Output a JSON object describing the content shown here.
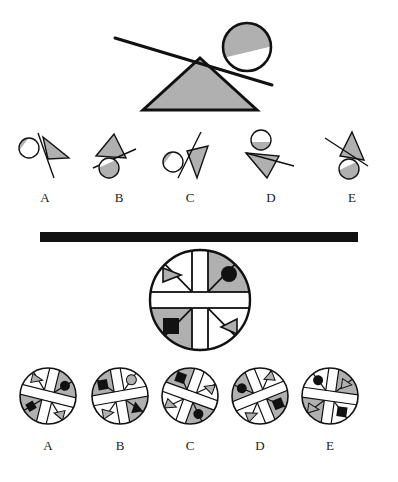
{
  "figure": {
    "title": "",
    "type": "visual-analogy-puzzle",
    "panels": [
      {
        "id": "top",
        "name": "upper-problem-panel",
        "prompt_figure": {
          "name": "lever-fulcrum-ball",
          "elements": [
            "triangle-fulcrum-gray",
            "lever-line",
            "circle-ball-split-gray-top"
          ]
        },
        "options": [
          {
            "label": "A",
            "name": "option-a",
            "elements": [
              "circle-split-gray",
              "triangle-gray-right",
              "line-diagonal"
            ]
          },
          {
            "label": "B",
            "name": "option-b",
            "elements": [
              "triangle-gray-up",
              "line-diagonal",
              "circle-split-gray-below"
            ]
          },
          {
            "label": "C",
            "name": "option-c",
            "elements": [
              "circle-split-gray",
              "triangle-gray-down",
              "line-steep"
            ]
          },
          {
            "label": "D",
            "name": "option-d",
            "elements": [
              "circle-split-gray-top",
              "triangle-gray-down",
              "line-horizontal"
            ]
          },
          {
            "label": "E",
            "name": "option-e",
            "elements": [
              "triangle-gray-down",
              "line-diagonal",
              "circle-split-gray-below"
            ]
          }
        ]
      },
      {
        "id": "bottom",
        "name": "lower-problem-panel",
        "prompt_figure": {
          "name": "quartered-circle-large",
          "cross_color": "#ffffff",
          "quadrants": [
            {
              "position": "top-left",
              "fill": "white",
              "icon": "triangle-right-gray",
              "slash": "x-line"
            },
            {
              "position": "top-right",
              "fill": "gray",
              "icon": "circle-black",
              "slash": "x-line"
            },
            {
              "position": "bottom-left",
              "fill": "gray",
              "icon": "square-black",
              "slash": "x-line"
            },
            {
              "position": "bottom-right",
              "fill": "white",
              "icon": "triangle-left-gray",
              "slash": "x-line"
            }
          ]
        },
        "options": [
          {
            "label": "A",
            "name": "option-a",
            "quadrants": [
              {
                "position": "top-left",
                "fill": "white",
                "icon": "triangle-gray"
              },
              {
                "position": "top-right",
                "fill": "gray",
                "icon": "circle-black"
              },
              {
                "position": "bottom-left",
                "fill": "gray",
                "icon": "diamond-black"
              },
              {
                "position": "bottom-right",
                "fill": "white",
                "icon": "triangle-gray"
              }
            ]
          },
          {
            "label": "B",
            "name": "option-b",
            "quadrants": [
              {
                "position": "top-left",
                "fill": "gray",
                "icon": "square-black"
              },
              {
                "position": "top-right",
                "fill": "white",
                "icon": "circle-gray"
              },
              {
                "position": "bottom-left",
                "fill": "white",
                "icon": "triangle-gray"
              },
              {
                "position": "bottom-right",
                "fill": "gray",
                "icon": "triangle-black"
              }
            ]
          },
          {
            "label": "C",
            "name": "option-c",
            "quadrants": [
              {
                "position": "top-left",
                "fill": "gray",
                "icon": "square-black"
              },
              {
                "position": "top-right",
                "fill": "white",
                "icon": "triangle-gray"
              },
              {
                "position": "bottom-left",
                "fill": "white",
                "icon": "triangle-gray"
              },
              {
                "position": "bottom-right",
                "fill": "gray",
                "icon": "circle-black"
              }
            ]
          },
          {
            "label": "D",
            "name": "option-d",
            "quadrants": [
              {
                "position": "top-left",
                "fill": "gray",
                "icon": "circle-black"
              },
              {
                "position": "top-right",
                "fill": "white",
                "icon": "triangle-gray"
              },
              {
                "position": "bottom-left",
                "fill": "white",
                "icon": "triangle-gray"
              },
              {
                "position": "bottom-right",
                "fill": "gray",
                "icon": "square-black"
              }
            ]
          },
          {
            "label": "E",
            "name": "option-e",
            "quadrants": [
              {
                "position": "top-left",
                "fill": "white",
                "icon": "circle-black"
              },
              {
                "position": "top-right",
                "fill": "gray",
                "icon": "triangle-gray"
              },
              {
                "position": "bottom-left",
                "fill": "gray",
                "icon": "triangle-gray"
              },
              {
                "position": "bottom-right",
                "fill": "white",
                "icon": "square-black"
              }
            ]
          }
        ]
      }
    ],
    "labels": {
      "top_options": [
        "A",
        "B",
        "C",
        "D",
        "E"
      ],
      "bottom_options": [
        "A",
        "B",
        "C",
        "D",
        "E"
      ]
    },
    "colors": {
      "gray_fill": "#b0b0b0",
      "black": "#111111",
      "white": "#ffffff",
      "stroke": "#111111",
      "background": "#ffffff"
    }
  }
}
